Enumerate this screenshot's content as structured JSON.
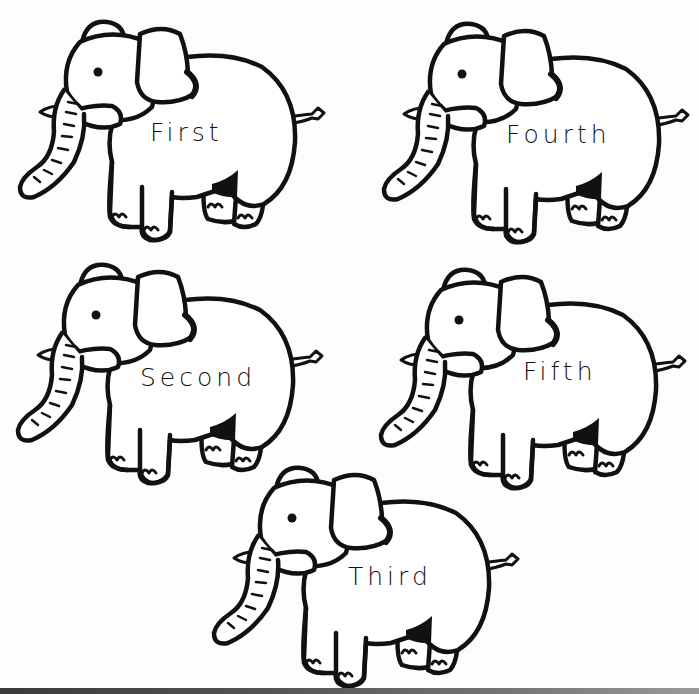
{
  "worksheet": {
    "title": "Ordinal number elephants",
    "elephants": [
      {
        "label": "First",
        "position": "top-left"
      },
      {
        "label": "Fourth",
        "position": "top-right"
      },
      {
        "label": "Second",
        "position": "middle-left"
      },
      {
        "label": "Fifth",
        "position": "middle-right"
      },
      {
        "label": "Third",
        "position": "bottom-center"
      }
    ]
  },
  "colors": {
    "background": "#fdfdfc",
    "outline": "#111111"
  }
}
